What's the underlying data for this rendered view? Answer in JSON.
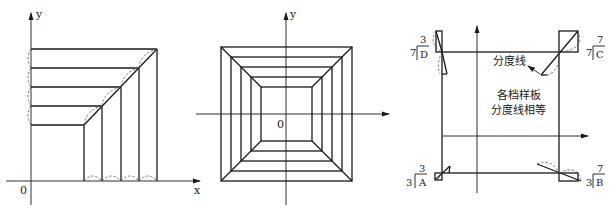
{
  "figure": {
    "panels": [
      {
        "id": "left",
        "description": "Quarter layout of nested right-angle sample templates with equal division lines",
        "axis_labels": {
          "x": "x",
          "y": "y",
          "origin": "0"
        }
      },
      {
        "id": "middle",
        "description": "Full nested square templates with diagonal division lines",
        "axis_labels": {
          "y": "y",
          "origin": "0"
        }
      },
      {
        "id": "right",
        "description": "Rectangle with corner templates A, B, C, D",
        "annotation_arrow": "分度线",
        "center_text_line1": "各档样板",
        "center_text_line2": "分度线相等",
        "corners": {
          "D": {
            "whole": "7",
            "numerator": "3",
            "letter": "D"
          },
          "C": {
            "whole": "7",
            "numerator": "7",
            "letter": "C"
          },
          "A": {
            "whole": "3",
            "numerator": "3",
            "letter": "A"
          },
          "B": {
            "whole": "3",
            "numerator": "7",
            "letter": "B"
          }
        }
      }
    ]
  }
}
